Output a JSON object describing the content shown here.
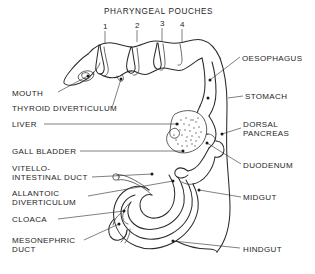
{
  "figure": {
    "title": "PHARYNGEAL POUCHES",
    "pouch_numbers": [
      "1",
      "2",
      "3",
      "4"
    ],
    "labels_left": [
      {
        "id": "mouth",
        "text": "MOUTH"
      },
      {
        "id": "thyroid-diverticulum",
        "text": "THYROID DIVERTICULUM"
      },
      {
        "id": "liver",
        "text": "LIVER"
      },
      {
        "id": "gall-bladder",
        "text": "GALL BLADDER"
      },
      {
        "id": "vitello-intestinal-duct-line1",
        "text": "VITELLO-"
      },
      {
        "id": "vitello-intestinal-duct-line2",
        "text": "INTESTINAL DUCT"
      },
      {
        "id": "allantoic-diverticulum-line1",
        "text": "ALLANTOIC"
      },
      {
        "id": "allantoic-diverticulum-line2",
        "text": "DIVERTICULUM"
      },
      {
        "id": "cloaca",
        "text": "CLOACA"
      },
      {
        "id": "mesonephric-duct-line1",
        "text": "MESONEPHRIC"
      },
      {
        "id": "mesonephric-duct-line2",
        "text": "DUCT"
      }
    ],
    "labels_right": [
      {
        "id": "oesophagus",
        "text": "OESOPHAGUS"
      },
      {
        "id": "stomach",
        "text": "STOMACH"
      },
      {
        "id": "dorsal-pancreas-line1",
        "text": "DORSAL"
      },
      {
        "id": "dorsal-pancreas-line2",
        "text": "PANCREAS"
      },
      {
        "id": "duodenum",
        "text": "DUODENUM"
      },
      {
        "id": "midgut",
        "text": "MIDGUT"
      },
      {
        "id": "hindgut",
        "text": "HINDGUT"
      }
    ],
    "colors": {
      "ink": "#2b2b2b",
      "text": "#262626",
      "background": "#ffffff",
      "leader": "#333333"
    }
  }
}
